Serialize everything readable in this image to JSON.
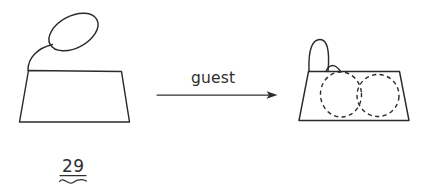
{
  "figure": {
    "caption": "29",
    "arrow_label": "guest",
    "ink_color": "#2b2b2b",
    "background_color": "#ffffff",
    "left_shape": {
      "name": "trapezoid-with-external-loop",
      "loop_label": "",
      "parts": [
        "trapezoid",
        "curved-stem",
        "tilted-ellipse"
      ]
    },
    "right_shape": {
      "name": "trapezoid-with-arch-and-two-dashed-ovals",
      "parts": [
        "trapezoid",
        "tall-arch",
        "small-bump",
        "dashed-oval-left",
        "dashed-oval-right"
      ]
    },
    "transform": {
      "label": "guest",
      "direction": "left-to-right"
    }
  }
}
